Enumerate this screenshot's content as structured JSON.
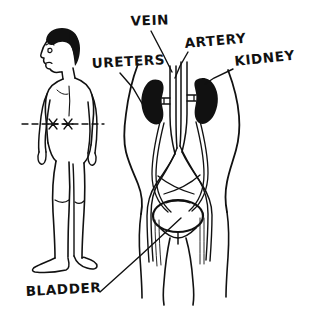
{
  "diagram": {
    "style": "hand-drawn black ink line art",
    "background_color": "#ffffff",
    "ink_color": "#111111"
  },
  "labels": [
    {
      "id": "vein",
      "text": "VEIN",
      "x": 150,
      "y": 25,
      "anchor": "middle"
    },
    {
      "id": "artery",
      "text": "ARTERY",
      "x": 185,
      "y": 48,
      "anchor": "start"
    },
    {
      "id": "kidney",
      "text": "KIDNEY",
      "x": 235,
      "y": 66,
      "anchor": "start"
    },
    {
      "id": "ureters",
      "text": "URETERS",
      "x": 92,
      "y": 68,
      "anchor": "start"
    },
    {
      "id": "bladder",
      "text": "BLADDER",
      "x": 26,
      "y": 296,
      "anchor": "start"
    }
  ],
  "leader_lines": [
    {
      "id": "vein-leader",
      "path": "M 151 31 L 163 54 L 172 72"
    },
    {
      "id": "artery-leader",
      "path": "M 188 52 L 180 66 L 175 78"
    },
    {
      "id": "kidney-leader",
      "path": "M 233 69 L 214 78 L 205 84"
    },
    {
      "id": "ureters-leader",
      "path": "M 120 73 L 133 88 L 147 112"
    },
    {
      "id": "bladder-leader",
      "path": "M 100 292 L 140 256 L 181 218"
    }
  ],
  "figure_person": {
    "name": "standing human figure, rear three-quarter view",
    "kidney_level_marker": {
      "name": "dashed waistline marker with two X marks at kidney level",
      "y": 124,
      "x_start": 22,
      "x_end": 104,
      "marks": [
        "X",
        "X"
      ]
    }
  },
  "anatomy_parts": [
    {
      "id": "torso-outline",
      "name": "abdominal torso outline"
    },
    {
      "id": "kidney-left",
      "name": "left kidney",
      "shading": "solid black bean shape"
    },
    {
      "id": "kidney-right",
      "name": "right kidney",
      "shading": "solid black bean shape"
    },
    {
      "id": "vena-cava",
      "name": "inferior vena cava (vein)"
    },
    {
      "id": "aorta",
      "name": "abdominal aorta (artery)"
    },
    {
      "id": "ureter-left",
      "name": "left ureter"
    },
    {
      "id": "ureter-right",
      "name": "right ureter"
    },
    {
      "id": "bladder",
      "name": "urinary bladder",
      "shape": "oval"
    },
    {
      "id": "iliac-vessels",
      "name": "iliac arteries and veins branching"
    }
  ]
}
